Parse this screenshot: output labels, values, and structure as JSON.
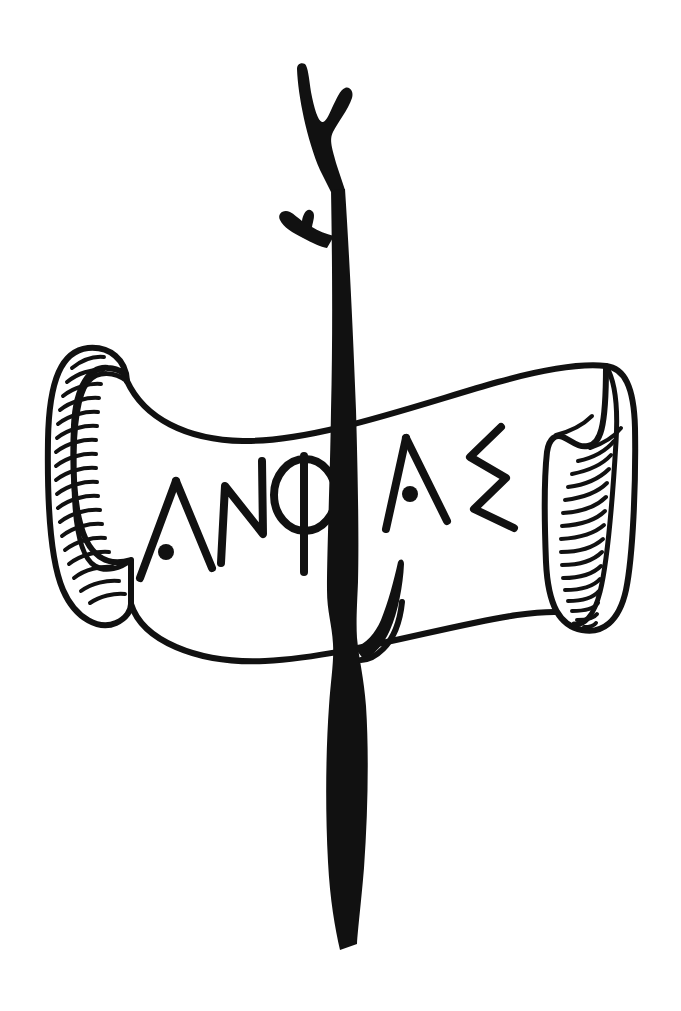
{
  "artwork": {
    "title": "Inscribed Scroll and Staff",
    "medium": "pen-and-ink line drawing",
    "width": 681,
    "height": 1011,
    "background_color": "#ffffff",
    "ink_color": "#111111"
  },
  "inscription": {
    "text": "ΛΝΦΛΣ",
    "transliteration": "ANPHAS",
    "script": "archaic-greek",
    "letters": [
      {
        "index": 1,
        "glyph": "Λ",
        "name": "lambda-with-dot",
        "has_dot": true
      },
      {
        "index": 2,
        "glyph": "Ν",
        "name": "nu",
        "has_dot": false
      },
      {
        "index": 3,
        "glyph": "Φ",
        "name": "phi",
        "has_dot": false
      },
      {
        "index": 4,
        "glyph": "Λ",
        "name": "lambda-with-dot",
        "has_dot": true
      },
      {
        "index": 5,
        "glyph": "Σ",
        "name": "sigma-zigzag",
        "has_dot": false
      }
    ]
  },
  "elements": {
    "banner": {
      "label": "ribbon-scroll",
      "left_curl_label": "left-rolled-end",
      "right_curl_label": "right-rolled-end",
      "hatch_count_left": 18,
      "hatch_count_right": 17,
      "face_label": "scroll-writing-surface"
    },
    "staff": {
      "label": "wooden-staff",
      "top_fork_label": "forked-tip",
      "upper_stub_label": "upper-branch-stub",
      "lower_stub_label": "lower-branch-stub",
      "bottom_label": "staff-base"
    }
  }
}
